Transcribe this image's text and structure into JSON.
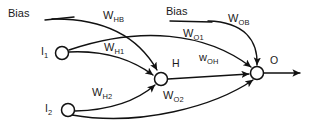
{
  "diagram": {
    "stroke_color": "#111111",
    "background_color": "#ffffff",
    "nodes": [
      {
        "id": "i1",
        "label": "I",
        "sub": "1",
        "cx": 62,
        "cy": 53,
        "r": 6.5,
        "label_x": 41,
        "label_y": 47,
        "type": "input"
      },
      {
        "id": "i2",
        "label": "I",
        "sub": "2",
        "cx": 68,
        "cy": 110,
        "r": 6.5,
        "label_x": 45,
        "label_y": 104,
        "type": "input"
      },
      {
        "id": "h",
        "label": "H",
        "sub": "",
        "cx": 161,
        "cy": 79,
        "r": 6.5,
        "label_x": 172,
        "label_y": 58,
        "type": "hidden"
      },
      {
        "id": "o",
        "label": "O",
        "sub": "",
        "cx": 257,
        "cy": 73,
        "r": 6.5,
        "label_x": 270,
        "label_y": 55,
        "type": "output"
      }
    ],
    "bias_labels": [
      {
        "id": "bias-hidden",
        "text": "Bias",
        "x": 8,
        "y": 8
      },
      {
        "id": "bias-output",
        "text": "Bias",
        "x": 166,
        "y": 6
      }
    ],
    "weights": [
      {
        "id": "w-hb",
        "symbol": "W",
        "sub": "HB",
        "x": 103,
        "y": 11,
        "from": "bias-hidden",
        "to": "h"
      },
      {
        "id": "w-h1",
        "symbol": "W",
        "sub": "H1",
        "x": 104,
        "y": 43,
        "from": "i1",
        "to": "h"
      },
      {
        "id": "w-h2",
        "symbol": "W",
        "sub": "H2",
        "x": 92,
        "y": 88,
        "from": "i2",
        "to": "h"
      },
      {
        "id": "w-ob",
        "symbol": "W",
        "sub": "OB",
        "x": 228,
        "y": 14,
        "from": "bias-output",
        "to": "o"
      },
      {
        "id": "w-o1",
        "symbol": "W",
        "sub": "O1",
        "x": 183,
        "y": 29,
        "from": "i1",
        "to": "o"
      },
      {
        "id": "w-o2",
        "symbol": "W",
        "sub": "O2",
        "x": 163,
        "y": 91,
        "from": "i2",
        "to": "o"
      },
      {
        "id": "w-oh",
        "symbol": "w",
        "sub": "OH",
        "x": 199,
        "y": 53,
        "from": "h",
        "to": "o"
      }
    ],
    "edges": [
      {
        "id": "edge-bias-h",
        "path": "M 52 19 C 110 18 140 40 157 70",
        "arrow": true
      },
      {
        "id": "edge-i1-h",
        "path": "M 69 52 C 110 50 135 62 153 75",
        "arrow": true
      },
      {
        "id": "edge-i2-h",
        "path": "M 75 111 C 115 110 140 98 155 85",
        "arrow": true
      },
      {
        "id": "edge-h-o",
        "path": "M 168 79 L 249 74",
        "arrow": true
      },
      {
        "id": "edge-i1-o",
        "path": "M 69 50 C 140 26 205 32 251 67",
        "arrow": true
      },
      {
        "id": "edge-i2-o",
        "path": "M 72 115 C 140 127 215 106 253 80",
        "arrow": true
      },
      {
        "id": "edge-bias-o",
        "path": "M 208 21 C 245 22 258 40 258 65",
        "arrow": true
      },
      {
        "id": "edge-output-arrow",
        "path": "M 264 73 L 303 73",
        "arrow": true
      }
    ],
    "bias_lines": [
      {
        "id": "bias-line-hidden",
        "x1": 45,
        "y1": 20,
        "x2": 74,
        "y2": 17
      },
      {
        "id": "bias-line-output",
        "x1": 170,
        "y1": 21,
        "x2": 212,
        "y2": 22
      }
    ]
  }
}
